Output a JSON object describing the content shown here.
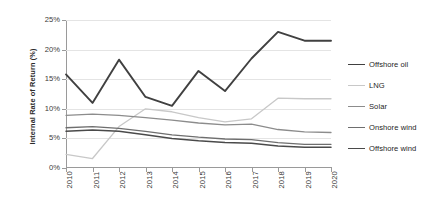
{
  "chart_data": {
    "type": "line",
    "title": "",
    "xlabel": "",
    "ylabel": "Internal Rate of Return (%)",
    "x": [
      2010,
      2011,
      2012,
      2013,
      2014,
      2015,
      2016,
      2017,
      2018,
      2019,
      2020
    ],
    "xtick_labels": [
      "2010",
      "2011",
      "2012",
      "2013",
      "2014",
      "2015",
      "2016",
      "2017",
      "2018",
      "2019",
      "2020"
    ],
    "ytick_labels": [
      "0%",
      "5%",
      "10%",
      "15%",
      "20%",
      "25%"
    ],
    "ytick_values": [
      0,
      5,
      10,
      15,
      20,
      25
    ],
    "ylim": [
      0,
      25
    ],
    "xlim": [
      2010,
      2020
    ],
    "grid": "horizontal",
    "legend_position": "right",
    "series": [
      {
        "name": "Offshore oil",
        "color": "#404040",
        "width": 1.9,
        "values": [
          15.8,
          11.0,
          18.3,
          12.0,
          10.5,
          16.4,
          13.0,
          18.5,
          23.0,
          21.5,
          21.5
        ]
      },
      {
        "name": "LNG",
        "color": "#c8c8c8",
        "width": 1.3,
        "values": [
          2.3,
          1.6,
          7.0,
          10.0,
          9.5,
          8.5,
          7.8,
          8.3,
          11.8,
          11.7,
          11.7
        ]
      },
      {
        "name": "Solar",
        "color": "#8c8c8c",
        "width": 1.3,
        "values": [
          8.9,
          9.1,
          8.9,
          8.5,
          8.1,
          7.6,
          7.3,
          7.4,
          6.5,
          6.1,
          6.0
        ]
      },
      {
        "name": "Onshore wind",
        "color": "#6e6e6e",
        "width": 1.3,
        "values": [
          6.8,
          7.0,
          6.7,
          6.2,
          5.6,
          5.2,
          4.9,
          4.8,
          4.3,
          4.0,
          4.0
        ]
      },
      {
        "name": "Offshore wind",
        "color": "#4a4a4a",
        "width": 1.5,
        "values": [
          6.2,
          6.4,
          6.2,
          5.6,
          5.0,
          4.6,
          4.3,
          4.2,
          3.7,
          3.5,
          3.5
        ]
      }
    ]
  },
  "legend": {
    "items": [
      {
        "label": "Offshore oil"
      },
      {
        "label": "LNG"
      },
      {
        "label": "Solar"
      },
      {
        "label": "Onshore wind"
      },
      {
        "label": "Offshore wind"
      }
    ]
  }
}
